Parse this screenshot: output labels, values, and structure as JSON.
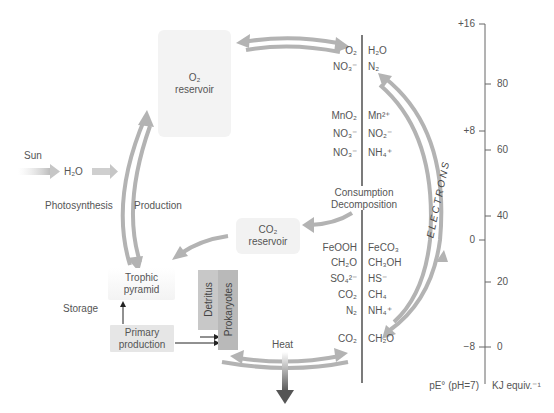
{
  "diagram": {
    "o2_reservoir": {
      "line1": "O₂",
      "line2": "reservoir"
    },
    "co2_reservoir": {
      "line1": "CO₂",
      "line2": "reservoir"
    },
    "sun_label": "Sun",
    "water_label": "H₂O",
    "photosynthesis_label": "Photosynthesis",
    "production_label": "Production",
    "storage_label": "Storage",
    "trophic_pyramid": {
      "line1": "Trophic",
      "line2": "pyramid"
    },
    "primary_production": {
      "line1": "Primary",
      "line2": "production"
    },
    "detritus_label": "Detritus",
    "prokaryotes_label": "Prokaryotes",
    "heat_label": "Heat",
    "consumption_label": "Consumption",
    "decomposition_label": "Decomposition",
    "electrons_label": "ELECTRONS",
    "redox_pairs": [
      {
        "oxidized": "O₂",
        "reduced": "H₂O"
      },
      {
        "oxidized": "NO₃⁻",
        "reduced": "N₂"
      },
      {
        "oxidized": "MnO₂",
        "reduced": "Mn²⁺"
      },
      {
        "oxidized": "NO₃⁻",
        "reduced": "NO₂⁻"
      },
      {
        "oxidized": "NO₃⁻",
        "reduced": "NH₄⁺"
      },
      {
        "oxidized": "FeOOH",
        "reduced": "FeCO₃"
      },
      {
        "oxidized": "CH₂O",
        "reduced": "CH₃OH"
      },
      {
        "oxidized": "SO₄²⁻",
        "reduced": "HS⁻"
      },
      {
        "oxidized": "CO₂",
        "reduced": "CH₄"
      },
      {
        "oxidized": "N₂",
        "reduced": "NH₄⁺"
      },
      {
        "oxidized": "CO₂",
        "reduced": "CH₂O"
      }
    ],
    "scale": {
      "pe_ticks": [
        "+16",
        "+8",
        "0",
        "−8"
      ],
      "kj_ticks": [
        "80",
        "60",
        "40",
        "20",
        "0"
      ],
      "pe_axis_label": "pE° (pH=7)",
      "kj_axis_label": "KJ equiv.⁻¹"
    },
    "colors": {
      "arrow_gray": "#b3b3b3",
      "box_light": "#f2f2f2",
      "primary_box": "#e6e6e6",
      "detritus_box": "#c8c8c8",
      "prokaryotes_box": "#b9b9b9",
      "line_dark": "#222222"
    }
  }
}
